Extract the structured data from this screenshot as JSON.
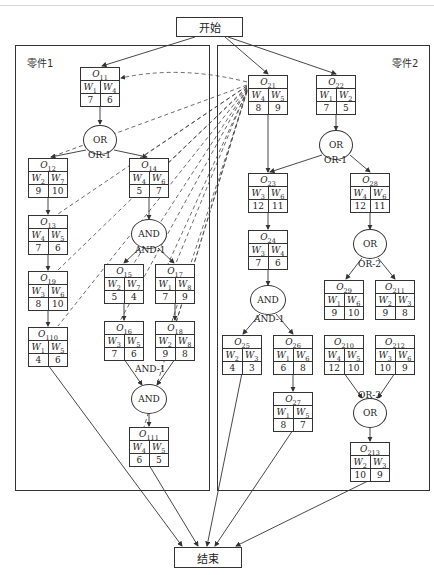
{
  "diagram": {
    "start_label": "开始",
    "end_label": "结束",
    "panels": [
      {
        "id": "part1",
        "label": "零件1"
      },
      {
        "id": "part2",
        "label": "零件2"
      }
    ],
    "nodes": [
      {
        "id": "O11",
        "op": "O",
        "sub": "11",
        "w": [
          "1",
          "4"
        ],
        "t": [
          "7",
          "6"
        ],
        "x": 80,
        "y": 67
      },
      {
        "id": "O12",
        "op": "O",
        "sub": "12",
        "w": [
          "2",
          "7"
        ],
        "t": [
          "9",
          "10"
        ],
        "x": 28,
        "y": 158
      },
      {
        "id": "O14",
        "op": "O",
        "sub": "14",
        "w": [
          "4",
          "6"
        ],
        "t": [
          "5",
          "7"
        ],
        "x": 129,
        "y": 158
      },
      {
        "id": "O13",
        "op": "O",
        "sub": "13",
        "w": [
          "4",
          "5"
        ],
        "t": [
          "7",
          "6"
        ],
        "x": 28,
        "y": 215
      },
      {
        "id": "O19",
        "op": "O",
        "sub": "19",
        "w": [
          "3",
          "6"
        ],
        "t": [
          "8",
          "10"
        ],
        "x": 28,
        "y": 271
      },
      {
        "id": "O110",
        "op": "O",
        "sub": "110",
        "w": [
          "1",
          "5"
        ],
        "t": [
          "4",
          "6"
        ],
        "x": 28,
        "y": 327
      },
      {
        "id": "O15",
        "op": "O",
        "sub": "15",
        "w": [
          "2",
          "7"
        ],
        "t": [
          "5",
          "4"
        ],
        "x": 104,
        "y": 264
      },
      {
        "id": "O17",
        "op": "O",
        "sub": "17",
        "w": [
          "1",
          "8"
        ],
        "t": [
          "7",
          "9"
        ],
        "x": 155,
        "y": 264
      },
      {
        "id": "O16",
        "op": "O",
        "sub": "16",
        "w": [
          "3",
          "5"
        ],
        "t": [
          "7",
          "6"
        ],
        "x": 104,
        "y": 321
      },
      {
        "id": "O18",
        "op": "O",
        "sub": "18",
        "w": [
          "2",
          "8"
        ],
        "t": [
          "9",
          "8"
        ],
        "x": 155,
        "y": 321
      },
      {
        "id": "O111",
        "op": "O",
        "sub": "111",
        "w": [
          "4",
          "5"
        ],
        "t": [
          "6",
          "5"
        ],
        "x": 129,
        "y": 427
      },
      {
        "id": "O21",
        "op": "O",
        "sub": "21",
        "w": [
          "4",
          "5"
        ],
        "t": [
          "8",
          "9"
        ],
        "x": 248,
        "y": 75
      },
      {
        "id": "O22",
        "op": "O",
        "sub": "22",
        "w": [
          "1",
          "2"
        ],
        "t": [
          "7",
          "5"
        ],
        "x": 316,
        "y": 75
      },
      {
        "id": "O23",
        "op": "O",
        "sub": "23",
        "w": [
          "3",
          "6"
        ],
        "t": [
          "12",
          "11"
        ],
        "x": 248,
        "y": 173
      },
      {
        "id": "O28",
        "op": "O",
        "sub": "28",
        "w": [
          "4",
          "6"
        ],
        "t": [
          "12",
          "11"
        ],
        "x": 350,
        "y": 173
      },
      {
        "id": "O24",
        "op": "O",
        "sub": "24",
        "w": [
          "3",
          "4"
        ],
        "t": [
          "7",
          "6"
        ],
        "x": 248,
        "y": 230
      },
      {
        "id": "O29",
        "op": "O",
        "sub": "29",
        "w": [
          "1",
          "6"
        ],
        "t": [
          "9",
          "10"
        ],
        "x": 324,
        "y": 280
      },
      {
        "id": "O211",
        "op": "O",
        "sub": "211",
        "w": [
          "2",
          "3"
        ],
        "t": [
          "9",
          "8"
        ],
        "x": 375,
        "y": 280
      },
      {
        "id": "O25",
        "op": "O",
        "sub": "25",
        "w": [
          "2",
          "3"
        ],
        "t": [
          "4",
          "3"
        ],
        "x": 222,
        "y": 335
      },
      {
        "id": "O26",
        "op": "O",
        "sub": "26",
        "w": [
          "1",
          "6"
        ],
        "t": [
          "6",
          "8"
        ],
        "x": 273,
        "y": 335
      },
      {
        "id": "O210",
        "op": "O",
        "sub": "210",
        "w": [
          "4",
          "5"
        ],
        "t": [
          "12",
          "10"
        ],
        "x": 324,
        "y": 335
      },
      {
        "id": "O212",
        "op": "O",
        "sub": "212",
        "w": [
          "3",
          "6"
        ],
        "t": [
          "10",
          "9"
        ],
        "x": 375,
        "y": 335
      },
      {
        "id": "O27",
        "op": "O",
        "sub": "27",
        "w": [
          "1",
          "5"
        ],
        "t": [
          "8",
          "7"
        ],
        "x": 273,
        "y": 392
      },
      {
        "id": "O213",
        "op": "O",
        "sub": "213",
        "w": [
          "2",
          "3"
        ],
        "t": [
          "10",
          "9"
        ],
        "x": 350,
        "y": 442
      }
    ],
    "gates": [
      {
        "id": "g1",
        "type": "OR",
        "label": "OR-1",
        "cx": 100,
        "cy": 140,
        "label_x": 88,
        "label_y": 152
      },
      {
        "id": "g2",
        "type": "AND",
        "label": "AND-1",
        "cx": 149,
        "cy": 234,
        "label_x": 135,
        "label_y": 247
      },
      {
        "id": "g3",
        "type": "AND",
        "label": "AND-1",
        "cx": 149,
        "cy": 399,
        "label_x": 135,
        "label_y": 366
      },
      {
        "id": "g4",
        "type": "OR",
        "label": "OR-1",
        "cx": 336,
        "cy": 145,
        "label_x": 324,
        "label_y": 157
      },
      {
        "id": "g5",
        "type": "OR",
        "label": "OR-2",
        "cx": 370,
        "cy": 244,
        "label_x": 358,
        "label_y": 261
      },
      {
        "id": "g6",
        "type": "AND",
        "label": "AND-1",
        "cx": 268,
        "cy": 300,
        "label_x": 254,
        "label_y": 316
      },
      {
        "id": "g7",
        "type": "OR",
        "label": "OR-2",
        "cx": 370,
        "cy": 413,
        "label_x": 358,
        "label_y": 392
      }
    ],
    "operation_symbol": "O",
    "machine_symbol": "W"
  }
}
